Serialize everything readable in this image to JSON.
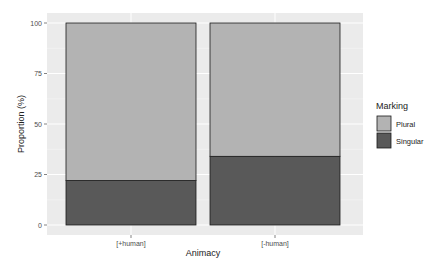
{
  "chart_data": {
    "type": "bar",
    "stacked": true,
    "title": "",
    "xlabel": "Animacy",
    "ylabel": "Proportion (%)",
    "ylim": [
      0,
      100
    ],
    "yticks": [
      0,
      25,
      50,
      75,
      100
    ],
    "categories": [
      "[+human]",
      "[-human]"
    ],
    "series": [
      {
        "name": "Singular",
        "values": [
          22,
          34
        ],
        "color": "#595959"
      },
      {
        "name": "Plural",
        "values": [
          78,
          66
        ],
        "color": "#b3b3b3"
      }
    ],
    "legend": {
      "title": "Marking",
      "position": "right",
      "entries": [
        "Plural",
        "Singular"
      ]
    },
    "grid": true,
    "panel_background": "#ebebeb"
  }
}
